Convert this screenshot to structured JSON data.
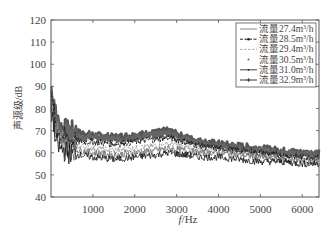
{
  "chart_data": {
    "type": "line",
    "title": "",
    "xlabel": "f/Hz",
    "ylabel": "声源级/dB",
    "xlim": [
      0,
      6400
    ],
    "ylim": [
      40,
      120
    ],
    "xticks": [
      1000,
      2000,
      3000,
      4000,
      5000,
      6000
    ],
    "yticks": [
      40,
      50,
      60,
      70,
      80,
      90,
      100,
      110,
      120
    ],
    "grid": false,
    "legend_position": "upper right",
    "series": [
      {
        "name": "流量27.4m³/h",
        "style": "solid",
        "color": "#777777",
        "x": [
          0,
          50,
          100,
          200,
          400,
          700,
          1000,
          1500,
          2000,
          2500,
          2800,
          3200,
          3600,
          4000,
          4500,
          5000,
          5500,
          6000,
          6400
        ],
        "y": [
          80,
          78,
          70,
          64,
          62,
          61,
          60,
          59,
          60,
          61,
          62,
          61,
          60,
          60,
          59,
          58,
          57,
          56,
          56
        ]
      },
      {
        "name": "流量28.5m³/h",
        "style": "dash-dot-marker",
        "color": "#222222",
        "x": [
          0,
          50,
          100,
          200,
          400,
          700,
          1000,
          1500,
          2000,
          2500,
          2800,
          3200,
          3600,
          4000,
          4500,
          5000,
          5500,
          6000,
          6400
        ],
        "y": [
          84,
          82,
          74,
          68,
          66,
          65,
          65,
          64,
          65,
          66,
          67,
          65,
          63,
          62,
          61,
          60,
          59,
          58,
          58
        ]
      },
      {
        "name": "流量29.4m³/h",
        "style": "dashed",
        "color": "#999999",
        "x": [
          0,
          50,
          100,
          200,
          400,
          700,
          1000,
          1500,
          2000,
          2500,
          2800,
          3200,
          3600,
          4000,
          4500,
          5000,
          5500,
          6000,
          6400
        ],
        "y": [
          82,
          80,
          72,
          66,
          64,
          63,
          62,
          61,
          62,
          63,
          64,
          63,
          61,
          61,
          60,
          59,
          58,
          57,
          57
        ]
      },
      {
        "name": "流量30.5m³/h",
        "style": "dotted-marker",
        "color": "#666666",
        "x": [
          0,
          50,
          100,
          200,
          400,
          700,
          1000,
          1500,
          2000,
          2500,
          2800,
          3200,
          3600,
          4000,
          4500,
          5000,
          5500,
          6000,
          6400
        ],
        "y": [
          86,
          84,
          76,
          70,
          68,
          67,
          67,
          66,
          67,
          68,
          69,
          66,
          64,
          63,
          62,
          61,
          60,
          59,
          59
        ]
      },
      {
        "name": "流量31.0m³/h",
        "style": "solid-thin",
        "color": "#111111",
        "x": [
          0,
          50,
          100,
          200,
          400,
          700,
          1000,
          1500,
          2000,
          2500,
          2800,
          3200,
          3600,
          4000,
          4500,
          5000,
          5500,
          6000,
          6400
        ],
        "y": [
          78,
          76,
          66,
          62,
          60,
          59,
          58,
          57,
          58,
          59,
          60,
          59,
          58,
          58,
          57,
          56,
          56,
          55,
          55
        ]
      },
      {
        "name": "流量32.9m³/h",
        "style": "solid-plus-marker",
        "color": "#555555",
        "x": [
          0,
          50,
          100,
          200,
          400,
          700,
          1000,
          1500,
          2000,
          2500,
          2800,
          3200,
          3600,
          4000,
          4500,
          5000,
          5500,
          6000,
          6400
        ],
        "y": [
          88,
          86,
          78,
          72,
          70,
          69,
          68,
          67,
          68,
          69,
          70,
          67,
          65,
          64,
          63,
          62,
          61,
          60,
          60
        ]
      }
    ]
  },
  "axes": {
    "xlabel_italic": "f",
    "xlabel_rest": "/Hz",
    "ylabel": "声源级/dB"
  },
  "legend": {
    "items": [
      {
        "label": "流量27.4m",
        "sup": "3",
        "unit": "/h"
      },
      {
        "label": "流量28.5m",
        "sup": "3",
        "unit": "/h"
      },
      {
        "label": "流量29.4m",
        "sup": "3",
        "unit": "/h"
      },
      {
        "label": "流量30.5m",
        "sup": "3",
        "unit": "/h"
      },
      {
        "label": "流量31.0m",
        "sup": "3",
        "unit": "/h"
      },
      {
        "label": "流量32.9m",
        "sup": "3",
        "unit": "/h"
      }
    ]
  }
}
